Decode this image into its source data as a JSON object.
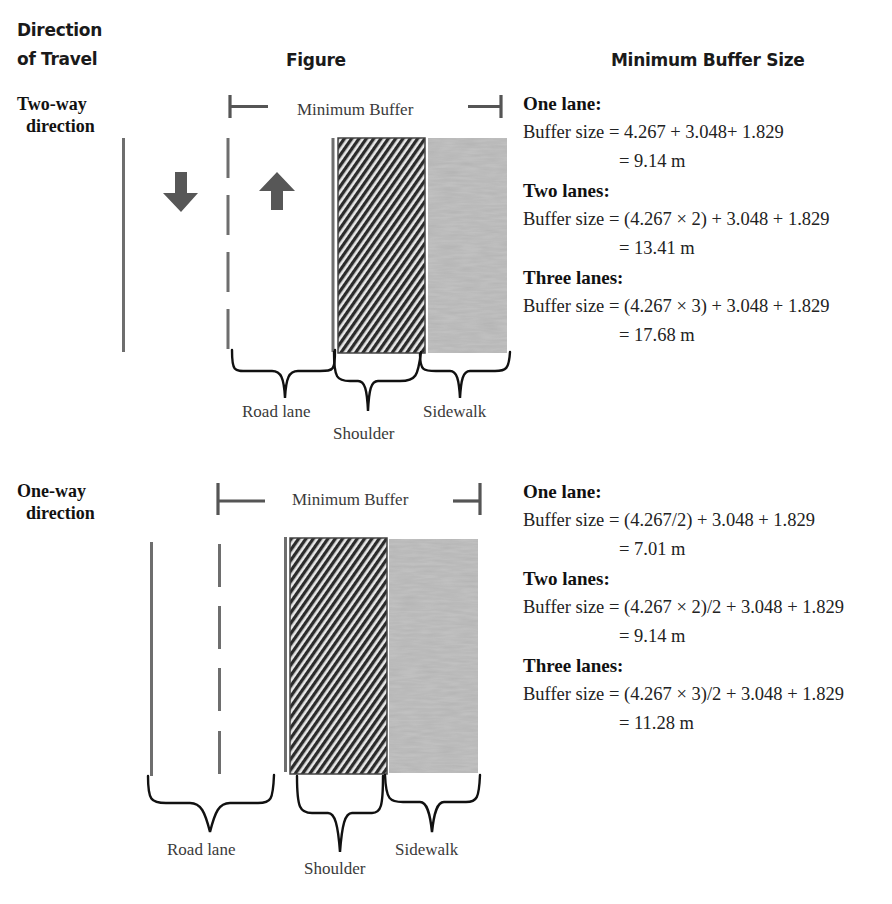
{
  "headers": {
    "direction_line1": "Direction",
    "direction_line2": "of Travel",
    "figure": "Figure",
    "min_buffer_size": "Minimum Buffer Size"
  },
  "two_way": {
    "label_line1": "Two-way",
    "label_line2": "direction",
    "bracket_label": "Minimum Buffer",
    "figure_labels": {
      "road_lane": "Road lane",
      "shoulder": "Shoulder",
      "sidewalk": "Sidewalk"
    },
    "arrows": [
      "arrow-down-icon",
      "arrow-up-icon"
    ],
    "formulas": [
      {
        "title": "One lane:",
        "prefix": "Buffer size",
        "expr": "= 4.267 + 3.048+ 1.829",
        "result": "= 9.14 m"
      },
      {
        "title": "Two lanes:",
        "prefix": "Buffer size",
        "expr": "= (4.267 × 2) + 3.048 + 1.829",
        "result": "= 13.41 m"
      },
      {
        "title": "Three lanes:",
        "prefix": "Buffer size",
        "expr": "= (4.267 × 3) + 3.048 + 1.829",
        "result": "= 17.68 m"
      }
    ]
  },
  "one_way": {
    "label_line1": "One-way",
    "label_line2": "direction",
    "bracket_label": "Minimum Buffer",
    "figure_labels": {
      "road_lane": "Road lane",
      "shoulder": "Shoulder",
      "sidewalk": "Sidewalk"
    },
    "formulas": [
      {
        "title": "One lane:",
        "prefix": "Buffer size",
        "expr": "= (4.267/2) + 3.048 + 1.829",
        "result": "= 7.01 m"
      },
      {
        "title": "Two lanes:",
        "prefix": "Buffer size",
        "expr": "= (4.267 × 2)/2 + 3.048 + 1.829",
        "result": "= 9.14 m"
      },
      {
        "title": "Three lanes:",
        "prefix": "Buffer size",
        "expr": "= (4.267 × 3)/2 + 3.048 + 1.829",
        "result": "= 11.28 m"
      }
    ]
  },
  "colors": {
    "line_gray": "#6e6e6e",
    "arrow_gray": "#555555",
    "shoulder_dark": "#2b2b2b",
    "sidewalk_gray": "#b4b4b4",
    "brace_black": "#111111"
  }
}
